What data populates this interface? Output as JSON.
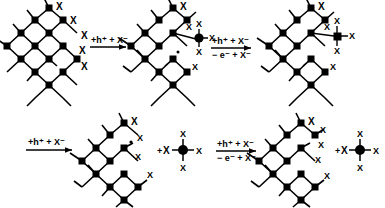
{
  "figure": {
    "ink_color": "#000000",
    "background_color": "#ffffff",
    "atom_label": "X",
    "radical_dot": "•",
    "plus_sign": "+"
  },
  "rows": [
    {
      "id": "top-row",
      "steps": [
        {
          "kind": "lattice",
          "name": "pristine-lattice",
          "surface_x_labels": [
            "X",
            "X",
            "X",
            "X",
            "X"
          ]
        },
        {
          "kind": "arrow",
          "name": "arrow-step-1",
          "above": "+h⁺ + X⁻",
          "below": ""
        },
        {
          "kind": "lattice",
          "name": "lattice-with-pendant-mx4",
          "surface_x_labels": [
            "X",
            "X",
            "X",
            "X",
            "X",
            "X"
          ]
        },
        {
          "kind": "arrow",
          "name": "arrow-step-2",
          "above": "+h⁺ + X⁻",
          "below": "− e⁻ + X⁻"
        },
        {
          "kind": "lattice",
          "name": "lattice-detaching-mx4",
          "surface_x_labels": [
            "X",
            "X",
            "X",
            "X",
            "X",
            "X"
          ]
        }
      ]
    },
    {
      "id": "bottom-row",
      "steps": [
        {
          "kind": "arrow",
          "name": "arrow-step-3",
          "above": "+h⁺ + X⁻",
          "below": ""
        },
        {
          "kind": "lattice",
          "name": "lattice-after-first-release",
          "surface_x_labels": [
            "X",
            "X",
            "X",
            "X"
          ]
        },
        {
          "kind": "plus",
          "name": "plus-sign-1",
          "label": "+"
        },
        {
          "kind": "x-label",
          "name": "free-halide-1",
          "label": "X"
        },
        {
          "kind": "mx4",
          "name": "released-mx4-unit-1",
          "ligands": [
            "X",
            "X",
            "X",
            "X"
          ]
        },
        {
          "kind": "arrow",
          "name": "arrow-step-4",
          "above": "+h⁺ + X⁻",
          "below": "− e⁻ + X⁻"
        },
        {
          "kind": "lattice",
          "name": "lattice-final",
          "surface_x_labels": [
            "X",
            "X",
            "X",
            "X",
            "X"
          ]
        },
        {
          "kind": "plus",
          "name": "plus-sign-2",
          "label": "+"
        },
        {
          "kind": "x-label",
          "name": "free-halide-2",
          "label": "X"
        },
        {
          "kind": "mx4",
          "name": "released-mx4-unit-2",
          "ligands": [
            "X",
            "X",
            "X",
            "X"
          ]
        }
      ]
    }
  ],
  "arrow_labels": {
    "step1_above": "+h⁺ + X⁻",
    "step1_below": "",
    "step2_above": "+h⁺ + X⁻",
    "step2_below": "− e⁻ + X⁻",
    "step3_above": "+h⁺ + X⁻",
    "step3_below": "",
    "step4_above": "+h⁺ + X⁻",
    "step4_below": "− e⁻ + X⁻"
  },
  "x_labels": {
    "l1a": "X",
    "l1b": "X",
    "l1c": "X",
    "l1d": "X",
    "l1e": "X",
    "l2a": "X",
    "l2b": "X",
    "l2c": "X",
    "l2d": "X",
    "l2e": "X",
    "l2f": "X",
    "l3a": "X",
    "l3b": "X",
    "l3c": "X",
    "l3d": "X",
    "l3e": "X",
    "l3f": "X",
    "l4a": "X",
    "l4b": "X",
    "l4c": "X",
    "l4d": "X",
    "l5a": "X",
    "l5b": "X",
    "l5c": "X",
    "l5d": "X",
    "l5e": "X",
    "u1t": "X",
    "u1l": "X",
    "u1r": "X",
    "u1b": "X",
    "u2t": "X",
    "u2l": "X",
    "u2r": "X",
    "u2b": "X",
    "free1": "X",
    "free2": "X",
    "plus1": "+",
    "plus2": "+"
  }
}
